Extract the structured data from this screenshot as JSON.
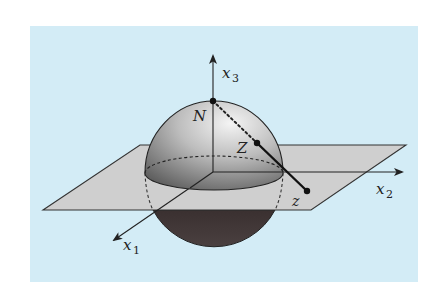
{
  "diagram": {
    "colors": {
      "background_panel": "#d3ecf6",
      "plane_fill": "#cfcfcf",
      "sphere_upper_light": "#e6e6e6",
      "sphere_upper_dark": "#6e6e6e",
      "sphere_lower": "#3e3434",
      "line": "#222222"
    },
    "axes": [
      {
        "name": "x1",
        "label_base": "x",
        "label_sub": "1"
      },
      {
        "name": "x2",
        "label_base": "x",
        "label_sub": "2"
      },
      {
        "name": "x3",
        "label_base": "x",
        "label_sub": "3"
      }
    ],
    "points": [
      {
        "name": "N",
        "label": "N",
        "description": "north pole"
      },
      {
        "name": "Z",
        "label": "Z",
        "description": "point on sphere"
      },
      {
        "name": "z",
        "label": "z",
        "description": "projected point on plane"
      }
    ]
  }
}
